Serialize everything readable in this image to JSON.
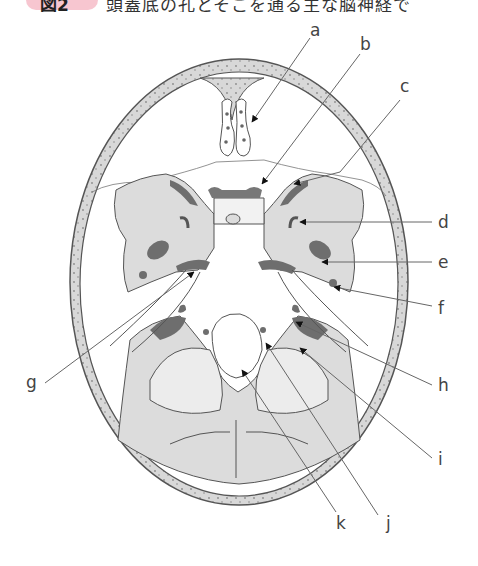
{
  "caption": {
    "badge": "図2",
    "text": "頭蓋底の孔とそこを通る主な脳神経で"
  },
  "diagram": {
    "labels": [
      "a",
      "b",
      "c",
      "d",
      "e",
      "f",
      "g",
      "h",
      "i",
      "j",
      "k"
    ],
    "colors": {
      "bone_fill": "#dcdcdc",
      "foramen_dark": "#6e6e6e",
      "outline": "#555555",
      "leader_line": "#666666",
      "arrowhead": "#111111",
      "badge_pink": "#f7c6d0"
    }
  }
}
